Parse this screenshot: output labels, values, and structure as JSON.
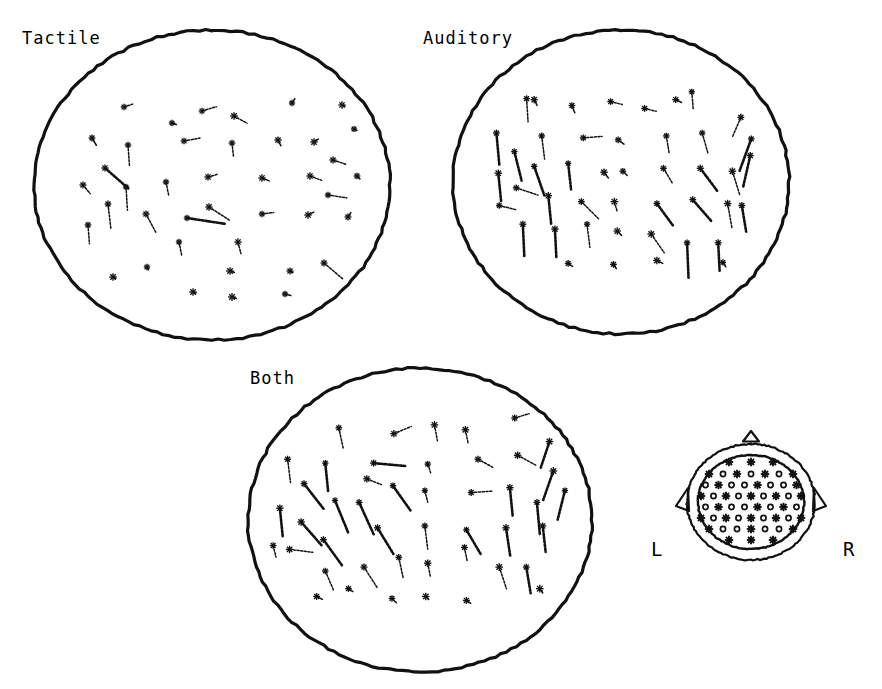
{
  "figure": {
    "background_color": "#ffffff",
    "ink_color": "#111111",
    "width": 882,
    "height": 689
  },
  "panels": [
    {
      "id": "tactile",
      "label": "Tactile",
      "label_x": 22,
      "label_y": 28,
      "ellipse": {
        "cx": 212,
        "cy": 185,
        "rx": 178,
        "ry": 155
      },
      "vector_count": 41
    },
    {
      "id": "auditory",
      "label": "Auditory",
      "label_x": 423,
      "label_y": 28,
      "ellipse": {
        "cx": 621,
        "cy": 182,
        "rx": 168,
        "ry": 152
      },
      "vector_count": 45
    },
    {
      "id": "both",
      "label": "Both",
      "label_x": 250,
      "label_y": 368,
      "ellipse": {
        "cx": 420,
        "cy": 520,
        "rx": 172,
        "ry": 152
      },
      "vector_count": 46
    }
  ],
  "montage": {
    "id": "electrode-montage",
    "left_label": "L",
    "right_label": "R",
    "left_label_x": 651,
    "left_label_y": 549,
    "right_label_x": 843,
    "right_label_y": 549,
    "center_x": 751,
    "center_y": 500,
    "outer_rx": 64,
    "outer_ry": 58,
    "inner_rx": 53,
    "inner_ry": 47,
    "nose": "triangle-top",
    "ears": "both-sides",
    "star_electrode_count": 26,
    "ring_electrode_count": 38
  },
  "chart_data": {
    "type": "scatter",
    "xlabel": "",
    "ylabel": "",
    "grid": false,
    "legend": "none",
    "series": [
      {
        "name": "Tactile",
        "note": "vectors: [x, y, dx, dy] in panel-local units, origin at ellipse centre, +x right, +y down",
        "vectors": [
          [
            -88,
            -78,
            6,
            -2
          ],
          [
            -10,
            -74,
            10,
            -3
          ],
          [
            -40,
            -62,
            3,
            1
          ],
          [
            22,
            -69,
            9,
            5
          ],
          [
            80,
            -82,
            2,
            -3
          ],
          [
            -120,
            -47,
            3,
            5
          ],
          [
            -84,
            -40,
            1,
            14
          ],
          [
            -28,
            -44,
            11,
            -2
          ],
          [
            20,
            -42,
            1,
            9
          ],
          [
            66,
            -45,
            2,
            4
          ],
          [
            102,
            -43,
            3,
            -2
          ],
          [
            142,
            -56,
            2,
            1
          ],
          [
            121,
            -25,
            9,
            3
          ],
          [
            -107,
            -17,
            16,
            14
          ],
          [
            -86,
            2,
            1,
            16
          ],
          [
            -129,
            0,
            5,
            6
          ],
          [
            -46,
            -3,
            2,
            10
          ],
          [
            -4,
            -8,
            7,
            -2
          ],
          [
            50,
            -7,
            5,
            2
          ],
          [
            98,
            -9,
            8,
            3
          ],
          [
            145,
            -9,
            2,
            2
          ],
          [
            116,
            10,
            13,
            2
          ],
          [
            -104,
            19,
            2,
            17
          ],
          [
            -66,
            29,
            7,
            13
          ],
          [
            -124,
            40,
            1,
            13
          ],
          [
            -25,
            33,
            26,
            4
          ],
          [
            -3,
            22,
            14,
            9
          ],
          [
            50,
            29,
            8,
            -1
          ],
          [
            96,
            30,
            4,
            -2
          ],
          [
            136,
            32,
            2,
            -3
          ],
          [
            -33,
            57,
            2,
            10
          ],
          [
            26,
            57,
            2,
            8
          ],
          [
            -65,
            82,
            1,
            2
          ],
          [
            -99,
            92,
            2,
            1
          ],
          [
            18,
            86,
            3,
            1
          ],
          [
            -19,
            107,
            2,
            1
          ],
          [
            20,
            112,
            3,
            1
          ],
          [
            78,
            86,
            2,
            1
          ],
          [
            73,
            109,
            4,
            1
          ],
          [
            112,
            78,
            13,
            11
          ],
          [
            130,
            -80,
            2,
            1
          ]
        ]
      },
      {
        "name": "Auditory",
        "note": "vectors: [x, y, dx, dy] in panel-local units, origin at ellipse centre",
        "vectors": [
          [
            -100,
            -85,
            1,
            16
          ],
          [
            -52,
            -78,
            2,
            5
          ],
          [
            -11,
            -82,
            8,
            2
          ],
          [
            25,
            -75,
            8,
            2
          ],
          [
            75,
            -92,
            1,
            12
          ],
          [
            127,
            -66,
            -6,
            14
          ],
          [
            -132,
            -50,
            2,
            22
          ],
          [
            -84,
            -47,
            2,
            16
          ],
          [
            -40,
            -45,
            13,
            -1
          ],
          [
            -3,
            -43,
            4,
            3
          ],
          [
            48,
            -47,
            2,
            12
          ],
          [
            86,
            -50,
            4,
            14
          ],
          [
            138,
            -44,
            -8,
            22
          ],
          [
            -113,
            -31,
            5,
            20
          ],
          [
            -130,
            -9,
            2,
            20
          ],
          [
            -92,
            -16,
            7,
            20
          ],
          [
            -56,
            -19,
            2,
            18
          ],
          [
            -18,
            -10,
            3,
            4
          ],
          [
            2,
            -11,
            3,
            3
          ],
          [
            45,
            -14,
            6,
            10
          ],
          [
            84,
            -14,
            12,
            16
          ],
          [
            118,
            -11,
            5,
            16
          ],
          [
            137,
            -27,
            -5,
            22
          ],
          [
            -111,
            6,
            15,
            5
          ],
          [
            -77,
            14,
            2,
            20
          ],
          [
            -42,
            20,
            12,
            12
          ],
          [
            -7,
            20,
            2,
            7
          ],
          [
            38,
            22,
            11,
            15
          ],
          [
            76,
            18,
            13,
            15
          ],
          [
            113,
            22,
            3,
            17
          ],
          [
            -129,
            24,
            12,
            3
          ],
          [
            -104,
            43,
            1,
            22
          ],
          [
            -70,
            48,
            1,
            20
          ],
          [
            -36,
            43,
            2,
            16
          ],
          [
            -4,
            50,
            3,
            3
          ],
          [
            32,
            53,
            9,
            13
          ],
          [
            -56,
            83,
            3,
            2
          ],
          [
            -8,
            84,
            2,
            3
          ],
          [
            38,
            80,
            4,
            2
          ],
          [
            70,
            62,
            1,
            24
          ],
          [
            103,
            62,
            1,
            20
          ],
          [
            108,
            82,
            2,
            3
          ],
          [
            -92,
            -84,
            2,
            4
          ],
          [
            128,
            24,
            3,
            18
          ],
          [
            58,
            -84,
            4,
            2
          ]
        ]
      },
      {
        "name": "Both",
        "note": "vectors: [x, y, dx, dy] in panel-local units, origin at ellipse centre",
        "vectors": [
          [
            -84,
            -94,
            3,
            14
          ],
          [
            -27,
            -88,
            12,
            -5
          ],
          [
            15,
            -97,
            2,
            11
          ],
          [
            47,
            -92,
            2,
            10
          ],
          [
            98,
            -104,
            10,
            -3
          ],
          [
            134,
            -80,
            -6,
            18
          ],
          [
            -137,
            -62,
            2,
            16
          ],
          [
            -98,
            -58,
            2,
            20
          ],
          [
            -48,
            -58,
            22,
            2
          ],
          [
            8,
            -57,
            2,
            6
          ],
          [
            60,
            -62,
            11,
            6
          ],
          [
            101,
            -66,
            13,
            7
          ],
          [
            138,
            -50,
            -7,
            20
          ],
          [
            -120,
            -37,
            14,
            18
          ],
          [
            -88,
            -20,
            9,
            22
          ],
          [
            -55,
            -42,
            10,
            4
          ],
          [
            -28,
            -35,
            12,
            17
          ],
          [
            5,
            -30,
            2,
            8
          ],
          [
            53,
            -28,
            15,
            -1
          ],
          [
            93,
            -33,
            2,
            20
          ],
          [
            121,
            -18,
            2,
            22
          ],
          [
            -145,
            -12,
            2,
            20
          ],
          [
            -123,
            2,
            14,
            16
          ],
          [
            -100,
            20,
            13,
            18
          ],
          [
            -63,
            -18,
            10,
            22
          ],
          [
            -44,
            8,
            11,
            18
          ],
          [
            5,
            6,
            2,
            16
          ],
          [
            48,
            10,
            10,
            17
          ],
          [
            89,
            8,
            3,
            20
          ],
          [
            127,
            6,
            2,
            18
          ],
          [
            -152,
            26,
            2,
            8
          ],
          [
            -135,
            30,
            16,
            2
          ],
          [
            -98,
            52,
            6,
            14
          ],
          [
            -58,
            48,
            9,
            14
          ],
          [
            -22,
            38,
            3,
            14
          ],
          [
            8,
            44,
            2,
            10
          ],
          [
            46,
            28,
            2,
            10
          ],
          [
            82,
            48,
            5,
            15
          ],
          [
            110,
            48,
            3,
            18
          ],
          [
            -29,
            80,
            3,
            3
          ],
          [
            6,
            78,
            2,
            2
          ],
          [
            48,
            82,
            3,
            2
          ],
          [
            -107,
            78,
            4,
            2
          ],
          [
            -74,
            70,
            3,
            2
          ],
          [
            124,
            70,
            2,
            3
          ],
          [
            150,
            -30,
            -5,
            20
          ]
        ]
      }
    ],
    "montage_key": {
      "left_label": "L",
      "right_label": "R",
      "star_markers": 26,
      "ring_markers": 38
    }
  }
}
